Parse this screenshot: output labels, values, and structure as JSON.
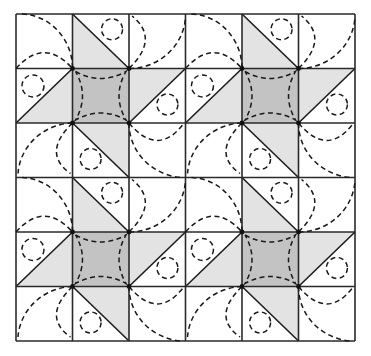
{
  "diagram": {
    "title": "Quilt block layout with dashed quilting motifs",
    "grid": {
      "rows": 6,
      "cols": 6,
      "block_rows": 2,
      "block_cols": 2,
      "cells_per_block": 3
    },
    "bounds": {
      "x": 16,
      "y": 14,
      "width": 339,
      "height": 327
    },
    "colors": {
      "background": "#ffffff",
      "light_fill": "#e3e3e3",
      "dark_fill": "#c3c3c3",
      "line": "#222222"
    },
    "block_cells": [
      {
        "pos": "top-left",
        "fill": "none",
        "motif": "quarter-arc and half-arc"
      },
      {
        "pos": "top-center",
        "fill": "light triangle lower-left",
        "motif": "small circle"
      },
      {
        "pos": "top-right",
        "fill": "none",
        "motif": "two arcs from bottom-left"
      },
      {
        "pos": "middle-left",
        "fill": "light triangle lower-right",
        "motif": "small circle"
      },
      {
        "pos": "center",
        "fill": "dark square",
        "motif": "inward-curved dashed square"
      },
      {
        "pos": "middle-right",
        "fill": "light triangle upper-left",
        "motif": "small circle"
      },
      {
        "pos": "bottom-left",
        "fill": "none",
        "motif": "two arcs from top-right"
      },
      {
        "pos": "bottom-center",
        "fill": "light triangle upper-right",
        "motif": "small circle"
      },
      {
        "pos": "bottom-right",
        "fill": "none",
        "motif": "two arcs from top-left"
      }
    ]
  }
}
